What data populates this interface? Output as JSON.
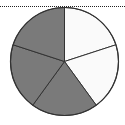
{
  "chart_data": {
    "type": "pie",
    "title": "",
    "slices": [
      {
        "label": "part 1",
        "value": 1,
        "shaded": false,
        "color": "#fafafa"
      },
      {
        "label": "part 2",
        "value": 1,
        "shaded": false,
        "color": "#fafafa"
      },
      {
        "label": "part 3",
        "value": 1,
        "shaded": true,
        "color": "#7a7a7a"
      },
      {
        "label": "part 4",
        "value": 1,
        "shaded": true,
        "color": "#7a7a7a"
      },
      {
        "label": "part 5",
        "value": 1,
        "shaded": true,
        "color": "#7a7a7a"
      }
    ],
    "total_parts": 5,
    "shaded_parts": 3,
    "start_angle_deg": 0,
    "direction": "clockwise",
    "legend": null
  },
  "style": {
    "outline_color": "#333333",
    "dotted_rule_color": "#222222"
  }
}
